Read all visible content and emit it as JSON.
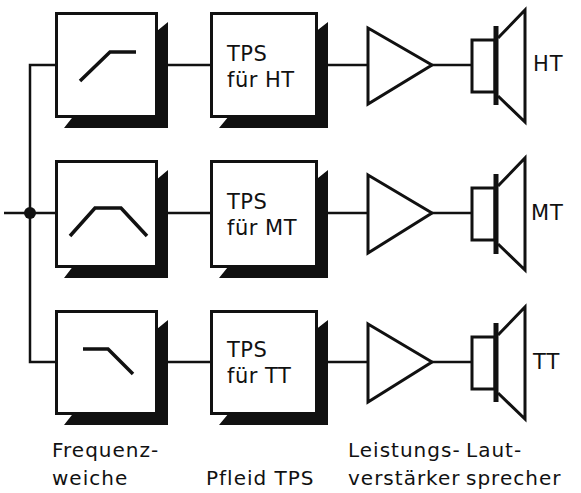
{
  "diagram": {
    "colors": {
      "line": "#111111",
      "background": "#ffffff"
    },
    "input": {
      "icon": "junction-dot-icon"
    },
    "rows": [
      {
        "id": "ht",
        "filter_icon": "highpass-curve-icon",
        "filter_type": "Hochpass",
        "tps_line1": "TPS",
        "tps_line2": "für HT",
        "amplifier_icon": "amplifier-triangle-icon",
        "speaker_icon": "speaker-icon",
        "speaker_label": "HT"
      },
      {
        "id": "mt",
        "filter_icon": "bandpass-curve-icon",
        "filter_type": "Bandpass",
        "tps_line1": "TPS",
        "tps_line2": "für MT",
        "amplifier_icon": "amplifier-triangle-icon",
        "speaker_icon": "speaker-icon",
        "speaker_label": "MT"
      },
      {
        "id": "tt",
        "filter_icon": "lowpass-curve-icon",
        "filter_type": "Tiefpass",
        "tps_line1": "TPS",
        "tps_line2": "für TT",
        "amplifier_icon": "amplifier-triangle-icon",
        "speaker_icon": "speaker-icon",
        "speaker_label": "TT"
      }
    ],
    "captions": {
      "crossover": {
        "line1": "Frequenz-",
        "line2": "weiche"
      },
      "tps": {
        "line1": "",
        "line2": "Pfleid TPS"
      },
      "amplifier": {
        "line1": "Leistungs-",
        "line2": "verstärker"
      },
      "speaker": {
        "line1": "Laut-",
        "line2": "sprecher"
      }
    }
  }
}
